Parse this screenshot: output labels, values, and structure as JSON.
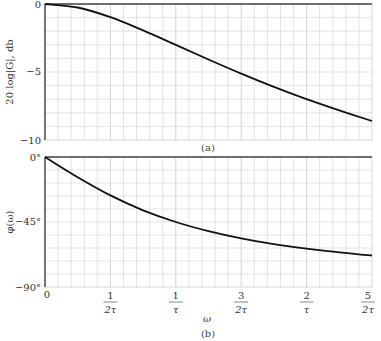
{
  "chart_data": [
    {
      "id": "a",
      "type": "line",
      "caption": "(a)",
      "title": "",
      "xlabel": "",
      "ylabel": "20 log|G|, db",
      "xlim_omega_tau": [
        0,
        2.5
      ],
      "ylim": [
        -10,
        0
      ],
      "yticks": [
        {
          "value": 0,
          "label": "0"
        },
        {
          "value": -5,
          "label": "−5"
        },
        {
          "value": -10,
          "label": "−10"
        }
      ],
      "grid": true,
      "grid_rows": 10,
      "grid_cols": 25,
      "series": [
        {
          "name": "magnitude",
          "x_omega_tau": [
            0,
            0.25,
            0.5,
            0.75,
            1.0,
            1.25,
            1.5,
            1.75,
            2.0,
            2.25,
            2.5
          ],
          "values": [
            0,
            -0.26,
            -0.97,
            -1.94,
            -3.01,
            -4.08,
            -5.12,
            -6.09,
            -6.99,
            -7.82,
            -8.6
          ]
        }
      ]
    },
    {
      "id": "b",
      "type": "line",
      "caption": "(b)",
      "title": "",
      "xlabel": "ω",
      "ylabel": "φ(ω)",
      "xlim_omega_tau": [
        0,
        2.5
      ],
      "ylim": [
        -90,
        0
      ],
      "yticks": [
        {
          "value": 0,
          "label": "0°"
        },
        {
          "value": -45,
          "label": "−45°"
        },
        {
          "value": -90,
          "label": "−90°"
        }
      ],
      "xticks": [
        {
          "value": 0,
          "num": "0",
          "den": ""
        },
        {
          "value": 0.5,
          "num": "1",
          "den": "2τ"
        },
        {
          "value": 1.0,
          "num": "1",
          "den": "τ"
        },
        {
          "value": 1.5,
          "num": "3",
          "den": "2τ"
        },
        {
          "value": 2.0,
          "num": "2",
          "den": "τ"
        },
        {
          "value": 2.5,
          "num": "5",
          "den": "2τ"
        }
      ],
      "grid": true,
      "grid_rows": 10,
      "grid_cols": 25,
      "series": [
        {
          "name": "phase",
          "x_omega_tau": [
            0,
            0.25,
            0.5,
            0.75,
            1.0,
            1.25,
            1.5,
            1.75,
            2.0,
            2.25,
            2.5
          ],
          "values": [
            0,
            -14.0,
            -26.6,
            -36.9,
            -45.0,
            -51.3,
            -56.3,
            -60.3,
            -63.4,
            -66.0,
            -68.2
          ]
        }
      ]
    }
  ],
  "labels": {
    "top_ylabel": "20  log|G|, db",
    "bottom_ylabel": "φ(ω)",
    "xlabel": "ω",
    "caption_a": "(a)",
    "caption_b": "(b)"
  }
}
